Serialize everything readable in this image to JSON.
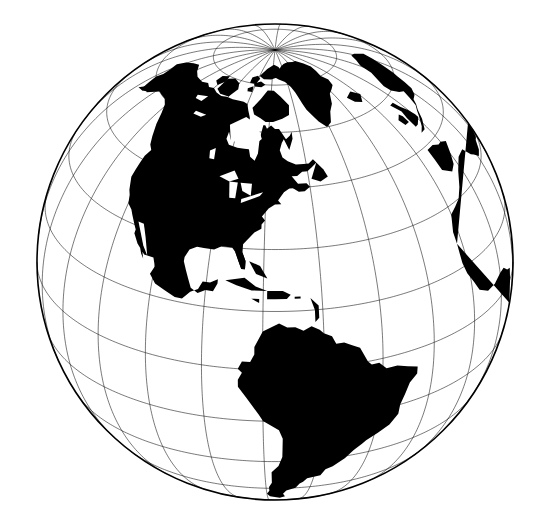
{
  "figure": {
    "description": "Black-and-white orthographic world globe centered on the Americas, showing North America, Central America, the Caribbean, South America, Greenland, and the western edges of Europe and Africa.",
    "background_color": "#ffffff",
    "land_color": "#000000",
    "ocean_color": "#ffffff",
    "graticule_color": "#000000",
    "limb_color": "#000000"
  },
  "projection": {
    "type": "orthographic",
    "center_longitude": -72,
    "center_latitude": 27,
    "rotation_deg": 0,
    "radius_px": 238,
    "center_x_px": 275,
    "center_y_px": 262
  },
  "graticule": {
    "meridian_step_deg": 15,
    "parallel_step_deg": 15,
    "equator_visible": true,
    "pole_visible": "north",
    "line_width_px": 0.7
  },
  "features": [
    {
      "name": "North America",
      "visible": true
    },
    {
      "name": "Greenland",
      "visible": true
    },
    {
      "name": "Central America",
      "visible": true
    },
    {
      "name": "Caribbean Islands",
      "visible": true
    },
    {
      "name": "South America",
      "visible": true
    },
    {
      "name": "Europe",
      "visible": "partial"
    },
    {
      "name": "Africa",
      "visible": "partial"
    },
    {
      "name": "Iceland",
      "visible": true
    },
    {
      "name": "Canadian Arctic Archipelago",
      "visible": true
    }
  ],
  "chart_data": {
    "type": "map",
    "projection": "orthographic",
    "center": [
      -72,
      27
    ],
    "radius_px": 238,
    "graticule_interval_deg": 15,
    "visible_hemisphere": "Western / Americas"
  }
}
